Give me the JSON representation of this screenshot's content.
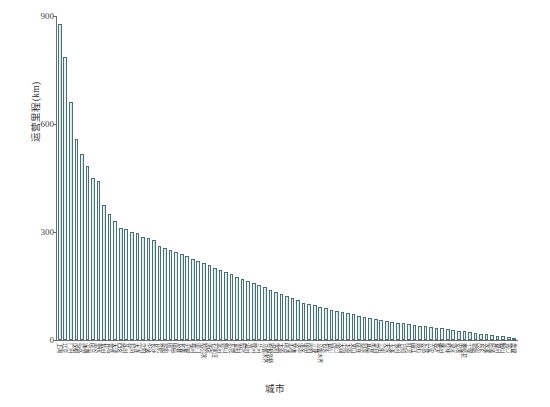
{
  "chart_data": {
    "type": "bar",
    "title": "",
    "xlabel": "城市",
    "ylabel": "运营里程(km)",
    "ylim": [
      0,
      900
    ],
    "yticks": [
      0,
      300,
      600,
      900
    ],
    "grid": false,
    "legend": null,
    "bar_fill": "#cdebef",
    "bar_edge": "#4a6f73",
    "categories": [
      "上海",
      "北京",
      "广州",
      "成都",
      "武汉",
      "深圳",
      "南京",
      "重庆",
      "杭州",
      "青岛",
      "天津",
      "西安",
      "苏州",
      "郑州",
      "大连",
      "沈阳",
      "宁波",
      "长沙",
      "合肥",
      "昆明",
      "南宁",
      "南昌",
      "长春",
      "无锡",
      "福州",
      "厦门",
      "哈尔滨",
      "济南",
      "石家庄",
      "常州",
      "佛山",
      "东莞",
      "贵阳",
      "绍兴",
      "温州",
      "徐州",
      "兰州",
      "乌鲁木齐",
      "呼和浩特",
      "洛阳",
      "太原",
      "南通",
      "芜湖",
      "济宁",
      "淮安",
      "南阳",
      "三亚",
      "乌鲁木齐",
      "包头",
      "银川",
      "海口",
      "大同",
      "太原",
      "文山",
      "南充",
      "自贡",
      "宜昌",
      "蒙自",
      "三明",
      "天水",
      "玉溪",
      "梅州",
      "日照",
      "红河",
      "丽江",
      "黄石",
      "东营",
      "六安",
      "临沂",
      "柳州",
      "桂林",
      "遵义",
      "安顺",
      "攀枝花",
      "十堰",
      "恩施",
      "丹东",
      "本溪",
      "抚顺",
      "锦州",
      "鞍山",
      "营口",
      "盘锦"
    ],
    "values": [
      879,
      787,
      660,
      558,
      518,
      484,
      449,
      443,
      375,
      350,
      330,
      312,
      308,
      300,
      296,
      286,
      282,
      278,
      260,
      255,
      250,
      244,
      238,
      232,
      226,
      220,
      214,
      208,
      200,
      194,
      188,
      182,
      176,
      170,
      164,
      158,
      152,
      146,
      140,
      134,
      128,
      122,
      116,
      110,
      104,
      100,
      96,
      92,
      88,
      84,
      80,
      77,
      74,
      71,
      68,
      65,
      62,
      59,
      56,
      53,
      50,
      48,
      46,
      44,
      42,
      40,
      38,
      36,
      34,
      32,
      30,
      28,
      26,
      24,
      22,
      20,
      18,
      16,
      14,
      12,
      10,
      8,
      5
    ]
  },
  "caption": {
    "text": ""
  }
}
